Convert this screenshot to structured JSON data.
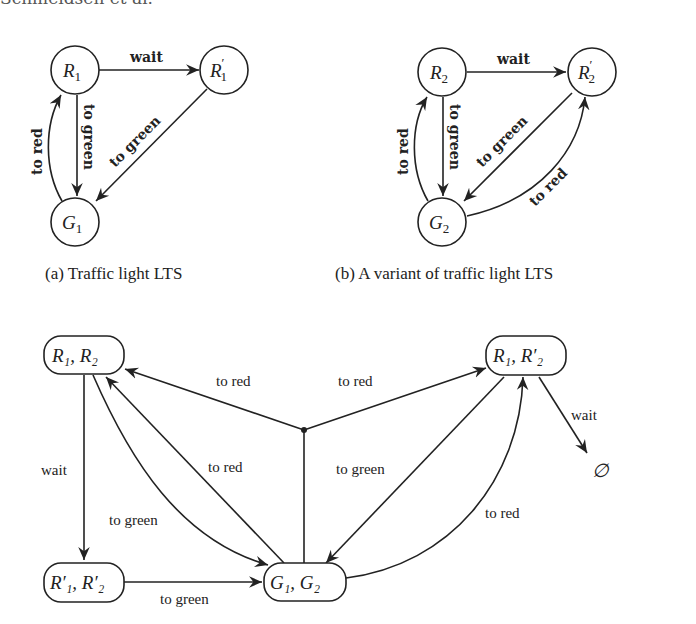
{
  "header": {
    "text": "Schmeidsen et al."
  },
  "figure_a": {
    "caption": "(a) Traffic light LTS",
    "nodes": [
      {
        "id": "R1",
        "label": "R",
        "sub": "1",
        "prime": ""
      },
      {
        "id": "R1p",
        "label": "R",
        "sub": "1",
        "prime": "′"
      },
      {
        "id": "G1",
        "label": "G",
        "sub": "1",
        "prime": ""
      }
    ],
    "edges": [
      {
        "from": "R1",
        "to": "R1p",
        "label": "wait"
      },
      {
        "from": "R1",
        "to": "G1",
        "label": "to green"
      },
      {
        "from": "G1",
        "to": "R1",
        "label": "to red"
      },
      {
        "from": "R1p",
        "to": "G1",
        "label": "to green"
      }
    ]
  },
  "figure_b": {
    "caption": "(b) A variant of traffic light LTS",
    "nodes": [
      {
        "id": "R2",
        "label": "R",
        "sub": "2",
        "prime": ""
      },
      {
        "id": "R2p",
        "label": "R",
        "sub": "2",
        "prime": "′"
      },
      {
        "id": "G2",
        "label": "G",
        "sub": "2",
        "prime": ""
      }
    ],
    "edges": [
      {
        "from": "R2",
        "to": "R2p",
        "label": "wait"
      },
      {
        "from": "R2",
        "to": "G2",
        "label": "to green"
      },
      {
        "from": "G2",
        "to": "R2",
        "label": "to red"
      },
      {
        "from": "R2p",
        "to": "G2",
        "label": "to green"
      },
      {
        "from": "G2",
        "to": "R2p",
        "label": "to red"
      }
    ]
  },
  "figure_c": {
    "nodes": [
      {
        "id": "R1R2",
        "label": "R₁, R₂"
      },
      {
        "id": "R1R2p",
        "label": "R₁, R′₂"
      },
      {
        "id": "R1pR2p",
        "label": "R′₁, R′₂"
      },
      {
        "id": "G1G2",
        "label": "G₁, G₂"
      },
      {
        "id": "empty",
        "label": "∅"
      }
    ],
    "edges": [
      {
        "from": "G1G2",
        "to": [
          "R1R2",
          "R1R2p"
        ],
        "label_left": "to red",
        "label_right": "to red",
        "type": "hyperedge"
      },
      {
        "from": "R1R2",
        "to": "R1pR2p",
        "label": "wait"
      },
      {
        "from": "R1R2",
        "to": "G1G2",
        "label": "to green"
      },
      {
        "from": "G1G2",
        "to": "R1R2",
        "label": "to red"
      },
      {
        "from": "R1pR2p",
        "to": "G1G2",
        "label": "to green"
      },
      {
        "from": "R1R2p",
        "to": "G1G2",
        "label": "to green"
      },
      {
        "from": "G1G2",
        "to": "R1R2p",
        "label": "to red"
      },
      {
        "from": "R1R2p",
        "to": "empty",
        "label": "wait"
      }
    ]
  }
}
